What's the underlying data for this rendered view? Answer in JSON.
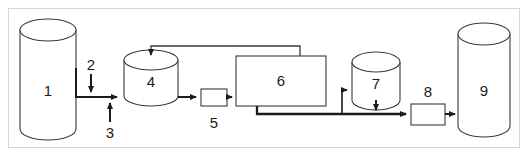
{
  "diagram": {
    "type": "process-flow-diagram",
    "frame": {
      "border_color": "#d6d6d6",
      "background_color": "#ffffff"
    },
    "stroke_color": "#3a3a3a",
    "line_color": "#1b1b1b",
    "label_color": "#1b1b1b",
    "nodes": [
      {
        "id": "1",
        "label": "1",
        "shape": "tall-cylinder",
        "name": "vessel-1"
      },
      {
        "id": "2",
        "label": "2",
        "shape": "inlet-arrow",
        "name": "inlet-2"
      },
      {
        "id": "3",
        "label": "3",
        "shape": "inlet-arrow",
        "name": "inlet-3"
      },
      {
        "id": "4",
        "label": "4",
        "shape": "short-cylinder",
        "name": "vessel-4"
      },
      {
        "id": "5",
        "label": "5",
        "shape": "small-box",
        "name": "unit-5"
      },
      {
        "id": "6",
        "label": "6",
        "shape": "large-box",
        "name": "unit-6"
      },
      {
        "id": "7",
        "label": "7",
        "shape": "short-cylinder",
        "name": "vessel-7"
      },
      {
        "id": "8",
        "label": "8",
        "shape": "small-box",
        "name": "unit-8"
      },
      {
        "id": "9",
        "label": "9",
        "shape": "tall-cylinder",
        "name": "vessel-9"
      }
    ]
  }
}
